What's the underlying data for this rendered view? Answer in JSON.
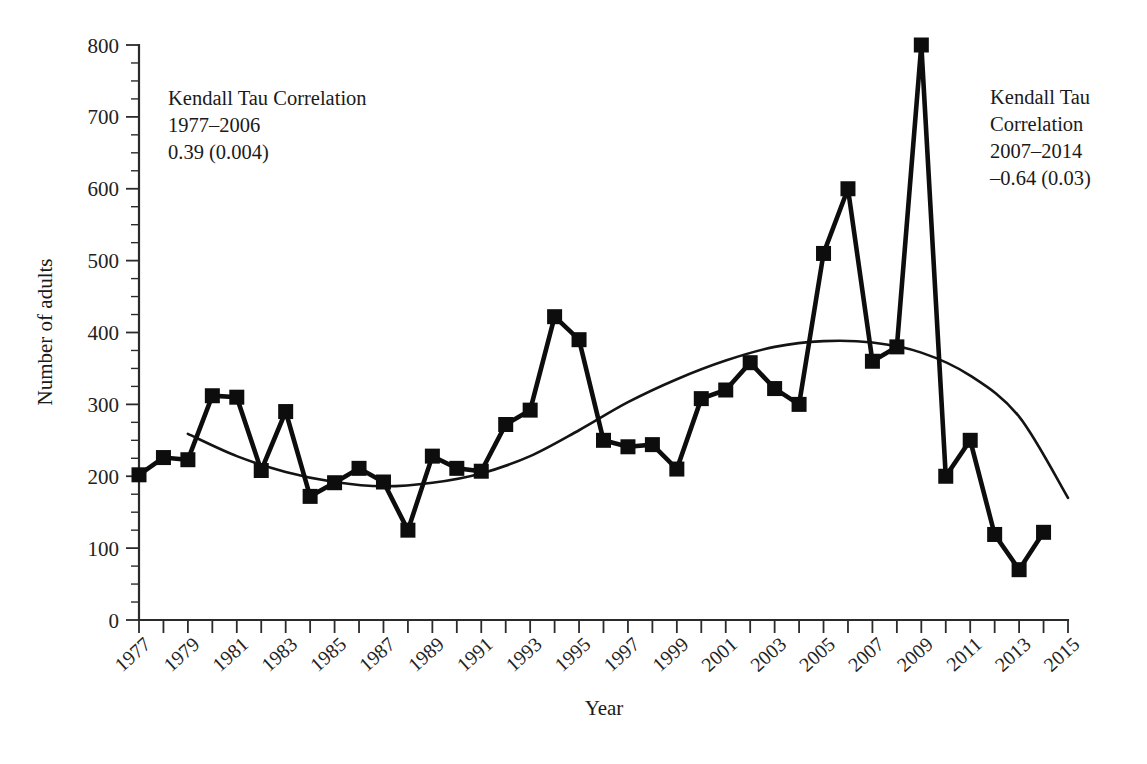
{
  "chart_data": {
    "type": "line",
    "title": "",
    "xlabel": "Year",
    "ylabel": "Number of adults",
    "xlim": [
      1977,
      2015
    ],
    "ylim": [
      0,
      800
    ],
    "ytick_step": 100,
    "yminor_step": 25,
    "xtick_step": 1,
    "xlabel_step": 2,
    "grid": false,
    "legend": "none",
    "marker": "square",
    "x": [
      1977,
      1978,
      1979,
      1980,
      1981,
      1982,
      1983,
      1984,
      1985,
      1986,
      1987,
      1988,
      1989,
      1990,
      1991,
      1992,
      1993,
      1994,
      1995,
      1996,
      1997,
      1998,
      1999,
      2000,
      2001,
      2002,
      2003,
      2004,
      2005,
      2006,
      2007,
      2008,
      2009,
      2010,
      2011,
      2012,
      2013,
      2014,
      2015
    ],
    "values": [
      202,
      226,
      223,
      312,
      310,
      208,
      290,
      172,
      191,
      211,
      192,
      125,
      228,
      211,
      207,
      272,
      292,
      422,
      390,
      250,
      241,
      244,
      210,
      308,
      320,
      358,
      322,
      300,
      510,
      600,
      360,
      380,
      800,
      200,
      250,
      119,
      70,
      122,
      null
    ],
    "series": [
      {
        "name": "Number of adults",
        "x": [
          1977,
          1978,
          1979,
          1980,
          1981,
          1982,
          1983,
          1984,
          1985,
          1986,
          1987,
          1988,
          1989,
          1990,
          1991,
          1992,
          1993,
          1994,
          1995,
          1996,
          1997,
          1998,
          1999,
          2000,
          2001,
          2002,
          2003,
          2004,
          2005,
          2006,
          2007,
          2008,
          2009,
          2010,
          2011,
          2012,
          2013,
          2014
        ],
        "values": [
          202,
          226,
          223,
          312,
          310,
          208,
          290,
          172,
          191,
          211,
          192,
          125,
          228,
          211,
          207,
          272,
          292,
          422,
          390,
          250,
          241,
          244,
          210,
          308,
          320,
          358,
          322,
          300,
          510,
          600,
          360,
          380,
          800,
          200,
          250,
          119,
          70,
          122
        ]
      },
      {
        "name": "smoothed-trend",
        "style": "smooth-curve",
        "x": [
          1979,
          1981,
          1983,
          1985,
          1987,
          1989,
          1991,
          1993,
          1995,
          1997,
          1999,
          2001,
          2003,
          2005,
          2007,
          2009,
          2011,
          2013,
          2015
        ],
        "values": [
          259,
          228,
          206,
          192,
          186,
          191,
          204,
          228,
          264,
          303,
          335,
          361,
          380,
          388,
          386,
          372,
          340,
          283,
          170
        ]
      }
    ],
    "ytick_labels": [
      "0",
      "100",
      "200",
      "300",
      "400",
      "500",
      "600",
      "700",
      "800"
    ],
    "xtick_labels": [
      "1977",
      "1979",
      "1981",
      "1983",
      "1985",
      "1987",
      "1989",
      "1991",
      "1993",
      "1995",
      "1997",
      "1999",
      "2001",
      "2003",
      "2005",
      "2007",
      "2009",
      "2011",
      "2013",
      "2015"
    ],
    "annotations": [
      {
        "id": "left-correlation",
        "lines": [
          "Kendall Tau Correlation",
          "1977–2006",
          "0.39 (0.004)"
        ]
      },
      {
        "id": "right-correlation",
        "lines": [
          "Kendall Tau",
          "Correlation",
          "2007–2014",
          "–0.64 (0.03)"
        ]
      }
    ],
    "colors": {
      "series": "#0d0d0d",
      "trend": "#141414",
      "axis": "#2b2b2b",
      "background": "#ffffff"
    }
  }
}
